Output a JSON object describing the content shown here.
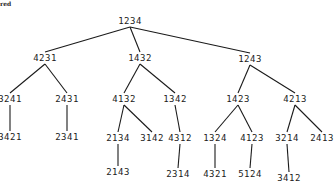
{
  "caption": "red",
  "tree": {
    "nodes": [
      {
        "id": "n1234",
        "label": "1234",
        "x": 130,
        "y": 21
      },
      {
        "id": "n4231",
        "label": "4231",
        "x": 45,
        "y": 58
      },
      {
        "id": "n1432",
        "label": "1432",
        "x": 140,
        "y": 58
      },
      {
        "id": "n1243",
        "label": "1243",
        "x": 250,
        "y": 59
      },
      {
        "id": "n3241",
        "label": "3241",
        "x": 10,
        "y": 99
      },
      {
        "id": "n2431",
        "label": "2431",
        "x": 67,
        "y": 99
      },
      {
        "id": "n4132",
        "label": "4132",
        "x": 124,
        "y": 99
      },
      {
        "id": "n1342",
        "label": "1342",
        "x": 175,
        "y": 99
      },
      {
        "id": "n1423",
        "label": "1423",
        "x": 238,
        "y": 99
      },
      {
        "id": "n4213",
        "label": "4213",
        "x": 295,
        "y": 99
      },
      {
        "id": "n3421",
        "label": "3421",
        "x": 10,
        "y": 137
      },
      {
        "id": "n2341",
        "label": "2341",
        "x": 67,
        "y": 137
      },
      {
        "id": "n2134",
        "label": "2134",
        "x": 118,
        "y": 138
      },
      {
        "id": "n3142",
        "label": "3142",
        "x": 152,
        "y": 138
      },
      {
        "id": "n4312",
        "label": "4312",
        "x": 180,
        "y": 138
      },
      {
        "id": "n1324",
        "label": "1324",
        "x": 215,
        "y": 138
      },
      {
        "id": "n4123",
        "label": "4123",
        "x": 252,
        "y": 138
      },
      {
        "id": "n3214",
        "label": "3214",
        "x": 287,
        "y": 138
      },
      {
        "id": "n2413",
        "label": "2413",
        "x": 322,
        "y": 138
      },
      {
        "id": "n2143",
        "label": "2143",
        "x": 118,
        "y": 172
      },
      {
        "id": "n2314",
        "label": "2314",
        "x": 178,
        "y": 174
      },
      {
        "id": "n4321",
        "label": "4321",
        "x": 215,
        "y": 174
      },
      {
        "id": "n5124",
        "label": "5124",
        "x": 250,
        "y": 174
      },
      {
        "id": "n3412",
        "label": "3412",
        "x": 289,
        "y": 178
      }
    ],
    "edges": [
      [
        "n1234",
        "n4231"
      ],
      [
        "n1234",
        "n1432"
      ],
      [
        "n1234",
        "n1243"
      ],
      [
        "n4231",
        "n3241"
      ],
      [
        "n4231",
        "n2431"
      ],
      [
        "n1432",
        "n4132"
      ],
      [
        "n1432",
        "n1342"
      ],
      [
        "n1243",
        "n1423"
      ],
      [
        "n1243",
        "n4213"
      ],
      [
        "n3241",
        "n3421"
      ],
      [
        "n2431",
        "n2341"
      ],
      [
        "n4132",
        "n2134"
      ],
      [
        "n4132",
        "n3142"
      ],
      [
        "n1342",
        "n4312"
      ],
      [
        "n1423",
        "n1324"
      ],
      [
        "n1423",
        "n4123"
      ],
      [
        "n4213",
        "n3214"
      ],
      [
        "n4213",
        "n2413"
      ],
      [
        "n2134",
        "n2143"
      ],
      [
        "n4312",
        "n2314"
      ],
      [
        "n1324",
        "n4321"
      ],
      [
        "n4123",
        "n5124"
      ],
      [
        "n3214",
        "n3412"
      ]
    ]
  }
}
